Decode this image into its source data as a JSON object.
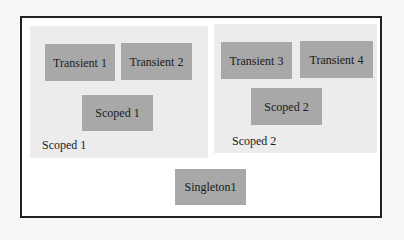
{
  "diagram": {
    "scopes": [
      {
        "label": "Scoped 1",
        "transients": [
          "Transient 1",
          "Transient 2"
        ],
        "scoped_service": "Scoped 1"
      },
      {
        "label": "Scoped 2",
        "transients": [
          "Transient 3",
          "Transient 4"
        ],
        "scoped_service": "Scoped 2"
      }
    ],
    "singleton": "Singleton1"
  },
  "colors": {
    "frame_border": "#222222",
    "frame_background": "#ffffff",
    "region_background": "#ececec",
    "node_fill": "#a8a8a8",
    "text": "#1a1a1a"
  }
}
